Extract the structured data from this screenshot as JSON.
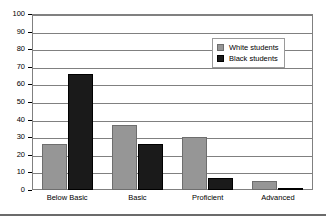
{
  "chart_data": {
    "type": "bar",
    "title": "",
    "subtitle": "",
    "xlabel": "",
    "ylabel": "",
    "categories": [
      "Below Basic",
      "Basic",
      "Proficient",
      "Advanced"
    ],
    "series": [
      {
        "name": "White students",
        "color": "#969696",
        "values": [
          26,
          37,
          30,
          5
        ]
      },
      {
        "name": "Black students",
        "color": "#1a1a1a",
        "values": [
          66,
          26,
          7,
          1
        ]
      }
    ],
    "ylim": [
      0,
      100
    ],
    "ytick_step": 10,
    "yticks": [
      0,
      10,
      20,
      30,
      40,
      50,
      60,
      70,
      80,
      90,
      100
    ],
    "ytick_labels": [
      "0",
      "10",
      "20",
      "30",
      "40",
      "50",
      "60",
      "70",
      "80",
      "90",
      "100"
    ],
    "grid": true,
    "grid_axis": "y",
    "legend_position": "upper-right-inside",
    "legend_entries": [
      "White students",
      "Black students"
    ],
    "annotations": []
  },
  "legend": {
    "items": [
      {
        "label": "White students",
        "swatch": "legend-swatch-white-students"
      },
      {
        "label": "Black students",
        "swatch": "legend-swatch-black-students"
      }
    ]
  }
}
